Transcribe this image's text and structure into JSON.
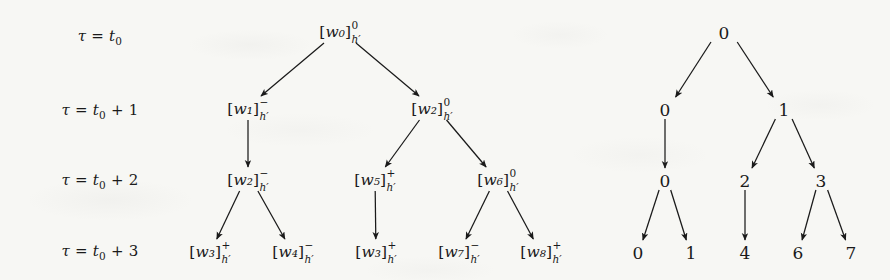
{
  "figure": {
    "background_color": "#f7f7f4",
    "ink_color": "#1a1a1a"
  },
  "time_labels": [
    {
      "id": "t0",
      "text": "τ = t₀",
      "tau": "τ",
      "eq": "=",
      "base": "t",
      "index": "0",
      "offset": "",
      "x": 100,
      "y": 38
    },
    {
      "id": "t0p1",
      "text": "τ = t₀ + 1",
      "tau": "τ",
      "eq": "=",
      "base": "t",
      "index": "0",
      "offset": "+ 1",
      "x": 100,
      "y": 112
    },
    {
      "id": "t0p2",
      "text": "τ = t₀ + 2",
      "tau": "τ",
      "eq": "=",
      "base": "t",
      "index": "0",
      "offset": "+ 2",
      "x": 100,
      "y": 182
    },
    {
      "id": "t0p3",
      "text": "τ = t₀ + 3",
      "tau": "τ",
      "eq": "=",
      "base": "t",
      "index": "0",
      "offset": "+ 3",
      "x": 100,
      "y": 253
    }
  ],
  "left_tree": {
    "name": "word-hypothesis-tree",
    "node_template": "[w<i>]^{sign}_{h'}",
    "subscript": "h′",
    "nodes": [
      {
        "id": "L0",
        "label": "w₀",
        "word": "w",
        "index": "0",
        "sup": "0",
        "sub": "h′",
        "level": 0,
        "x": 340,
        "y": 33
      },
      {
        "id": "L1",
        "label": "w₁",
        "word": "w",
        "index": "1",
        "sup": "−",
        "sub": "h′",
        "level": 1,
        "x": 248,
        "y": 110
      },
      {
        "id": "L2",
        "label": "w₂",
        "word": "w",
        "index": "2",
        "sup": "0",
        "sub": "h′",
        "level": 1,
        "x": 432,
        "y": 110
      },
      {
        "id": "L3",
        "label": "w₂",
        "word": "w",
        "index": "2",
        "sup": "−",
        "sub": "h′",
        "level": 2,
        "x": 248,
        "y": 181
      },
      {
        "id": "L4",
        "label": "w₅",
        "word": "w",
        "index": "5",
        "sup": "+",
        "sub": "h′",
        "level": 2,
        "x": 375,
        "y": 181
      },
      {
        "id": "L5",
        "label": "w₆",
        "word": "w",
        "index": "6",
        "sup": "0",
        "sub": "h′",
        "level": 2,
        "x": 498,
        "y": 181
      },
      {
        "id": "L6",
        "label": "w₃",
        "word": "w",
        "index": "3",
        "sup": "+",
        "sub": "h′",
        "level": 3,
        "x": 210,
        "y": 253
      },
      {
        "id": "L7",
        "label": "w₄",
        "word": "w",
        "index": "4",
        "sup": "−",
        "sub": "h′",
        "level": 3,
        "x": 293,
        "y": 253
      },
      {
        "id": "L8",
        "label": "w₃",
        "word": "w",
        "index": "3",
        "sup": "+",
        "sub": "h′",
        "level": 3,
        "x": 376,
        "y": 253
      },
      {
        "id": "L9",
        "label": "w₇",
        "word": "w",
        "index": "7",
        "sup": "−",
        "sub": "h′",
        "level": 3,
        "x": 459,
        "y": 253
      },
      {
        "id": "L10",
        "label": "w₈",
        "word": "w",
        "index": "8",
        "sup": "+",
        "sub": "h′",
        "level": 3,
        "x": 541,
        "y": 253
      }
    ],
    "edges": [
      {
        "from": "L0",
        "to": "L1"
      },
      {
        "from": "L0",
        "to": "L2"
      },
      {
        "from": "L1",
        "to": "L3"
      },
      {
        "from": "L2",
        "to": "L4"
      },
      {
        "from": "L2",
        "to": "L5"
      },
      {
        "from": "L3",
        "to": "L6"
      },
      {
        "from": "L3",
        "to": "L7"
      },
      {
        "from": "L4",
        "to": "L8"
      },
      {
        "from": "L5",
        "to": "L9"
      },
      {
        "from": "L5",
        "to": "L10"
      }
    ]
  },
  "right_tree": {
    "name": "index-tree",
    "nodes": [
      {
        "id": "R0",
        "label": "0",
        "level": 0,
        "x": 724,
        "y": 33
      },
      {
        "id": "R1",
        "label": "0",
        "level": 1,
        "x": 665,
        "y": 110
      },
      {
        "id": "R2",
        "label": "1",
        "level": 1,
        "x": 784,
        "y": 110
      },
      {
        "id": "R3",
        "label": "0",
        "level": 2,
        "x": 665,
        "y": 181
      },
      {
        "id": "R4",
        "label": "2",
        "level": 2,
        "x": 745,
        "y": 181
      },
      {
        "id": "R5",
        "label": "3",
        "level": 2,
        "x": 821,
        "y": 181
      },
      {
        "id": "R6",
        "label": "0",
        "level": 3,
        "x": 638,
        "y": 253
      },
      {
        "id": "R7",
        "label": "1",
        "level": 3,
        "x": 691,
        "y": 253
      },
      {
        "id": "R8",
        "label": "4",
        "level": 3,
        "x": 745,
        "y": 253
      },
      {
        "id": "R9",
        "label": "6",
        "level": 3,
        "x": 798,
        "y": 253
      },
      {
        "id": "R10",
        "label": "7",
        "level": 3,
        "x": 851,
        "y": 253
      }
    ],
    "edges": [
      {
        "from": "R0",
        "to": "R1"
      },
      {
        "from": "R0",
        "to": "R2"
      },
      {
        "from": "R1",
        "to": "R3"
      },
      {
        "from": "R2",
        "to": "R4"
      },
      {
        "from": "R2",
        "to": "R5"
      },
      {
        "from": "R3",
        "to": "R6"
      },
      {
        "from": "R3",
        "to": "R7"
      },
      {
        "from": "R4",
        "to": "R8"
      },
      {
        "from": "R5",
        "to": "R9"
      },
      {
        "from": "R5",
        "to": "R10"
      }
    ]
  }
}
